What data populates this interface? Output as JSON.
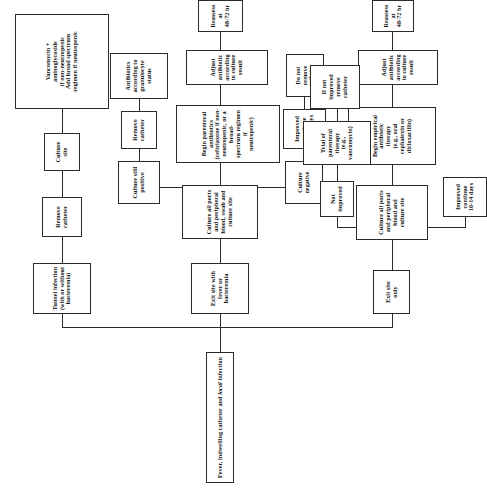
{
  "diagram": {
    "title": "Fever, indwelling catheter and local infection",
    "title_italic_word": "local",
    "orientation": "rotated-90-ccw",
    "type": "clinical-decision-flowchart",
    "colors": {
      "line": "#2b2b2b",
      "box_fill": "#ffffff",
      "text": "#111111",
      "page_background": "#ffffff"
    }
  },
  "nodes": {
    "root": "Fever, indwelling catheter and local infection",
    "tunnel_infection": "Tunnel infection\n(with or without\nbacteremia)",
    "remove_catheter_top": "Remove\ncatheter",
    "culture_site": "Culture\nsite",
    "vancomycin": "Vancomycin +\naminoglycoside\nif non-neutropenic\nAdd broad spectrum\nregimen if neutropenic",
    "exit_site_with_fever": "Exit site with\nfever or\nbacteremia",
    "culture_all_ports": "Culture all ports\nand peripheral\nblood, swab and\nculture site",
    "begin_parenteral": "Begin parenteral\nantibiotics\n(ceftriaxone if non-\nneutropenic, or a broad-\nspectrum regimen if\nneutropenic)",
    "adjust_antibiotic_mid": "Adjust antibiotic\naccording to culture result",
    "reassess_48_72_mid": "Reassess at\n48-72 hr",
    "culture_still_positive": "Culture still\npositive",
    "remove_catheter_right": "Remove\ncatheter",
    "antibiotics_granulocyte": "Antibiotics\naccording to\ngranulocyte\nstatus",
    "culture_negative": "Culture\nnegative",
    "improved_continue_right": "Improved\ncontinue\n10-14 days",
    "do_not_remove_catheter": "Do not remove\ncatheter",
    "exit_site_only": "Exit site\nonly",
    "culture_all_ports_bottom": "Culture all ports\nand peripheral\nblood and\nculture site",
    "begin_empirical": "Begin empirical antibiotic\ntherapy\n(e.g., oral cephalexin or dicloxacillin)",
    "adjust_antibiotic_bottom": "Adjust antibiotic\naccording to culture result",
    "reassess_48_72_bottom": "Reassess at\n48-72 hr",
    "improved_continue_bottom": "Improved\ncontinue\n10-14 days",
    "not_improved": "Not\nimproved",
    "trial_parenteral": "Trial of\nparenteral\ntherapy\n(e.g., vancomycin)",
    "if_not_improved": "If not improved\nremove catheter"
  },
  "flow": {
    "branches_from_root": [
      "tunnel_infection",
      "exit_site_with_fever",
      "exit_site_only"
    ],
    "tunnel_path": [
      "tunnel_infection",
      "remove_catheter_top",
      "culture_site",
      "vancomycin"
    ],
    "exit_site_fever_path": [
      "exit_site_with_fever",
      "culture_all_ports",
      "begin_parenteral",
      "adjust_antibiotic_mid",
      "reassess_48_72_mid"
    ],
    "reassess_mid_branches": [
      "culture_still_positive",
      "culture_negative"
    ],
    "culture_positive_path": [
      "culture_still_positive",
      "remove_catheter_right",
      "antibiotics_granulocyte"
    ],
    "culture_negative_path": [
      "culture_negative",
      "improved_continue_right",
      "do_not_remove_catheter"
    ],
    "exit_site_only_path": [
      "exit_site_only",
      "culture_all_ports_bottom",
      "begin_empirical",
      "adjust_antibiotic_bottom",
      "reassess_48_72_bottom"
    ],
    "reassess_bottom_branches": [
      "improved_continue_bottom",
      "not_improved"
    ],
    "not_improved_path": [
      "not_improved",
      "trial_parenteral",
      "if_not_improved"
    ]
  }
}
